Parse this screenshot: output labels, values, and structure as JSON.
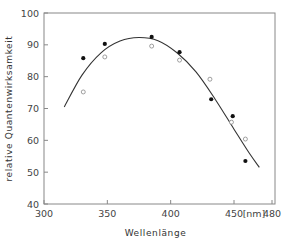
{
  "chart_data": {
    "type": "scatter",
    "title": "",
    "xlabel": "Wellenlänge",
    "ylabel": "relative Quantenwirksamkeit",
    "x_unit_label": "[nm]",
    "xlim": [
      300,
      480
    ],
    "ylim": [
      40,
      100
    ],
    "xticks": [
      300,
      350,
      400,
      450,
      480
    ],
    "yticks": [
      40,
      50,
      60,
      70,
      80,
      90,
      100
    ],
    "grid": false,
    "legend": null,
    "series": [
      {
        "name": "filled",
        "marker": "filled-circle",
        "x": [
          331,
          348,
          385,
          407,
          432,
          449,
          459
        ],
        "y": [
          85.8,
          90.3,
          92.5,
          87.7,
          72.9,
          67.6,
          53.5
        ]
      },
      {
        "name": "open",
        "marker": "open-circle",
        "x": [
          331,
          348,
          385,
          407,
          431,
          448,
          459
        ],
        "y": [
          75.2,
          86.2,
          89.6,
          85.2,
          79.2,
          65.7,
          60.4
        ]
      },
      {
        "name": "fit-curve",
        "type": "line",
        "x": [
          316,
          330,
          345,
          360,
          375,
          390,
          405,
          420,
          435,
          450,
          462,
          470
        ],
        "y": [
          70.5,
          80.5,
          87.5,
          91.2,
          92.3,
          91.3,
          87.5,
          81.5,
          73.0,
          63.5,
          56.0,
          51.5
        ]
      }
    ]
  }
}
